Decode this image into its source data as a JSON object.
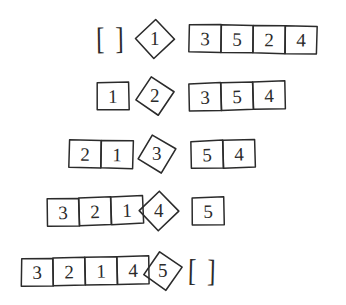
{
  "figure": {
    "kind": "hand-drawn-algorithm-trace",
    "ink_color": "#2b2b2b",
    "background_color": "#ffffff",
    "empty_list_open": "[",
    "empty_list_close": "]",
    "rows": [
      {
        "left": {
          "type": "empty",
          "values": []
        },
        "pivot": "1",
        "right": {
          "type": "cells",
          "values": [
            "3",
            "5",
            "2",
            "4"
          ]
        }
      },
      {
        "left": {
          "type": "cells",
          "values": [
            "1"
          ]
        },
        "pivot": "2",
        "right": {
          "type": "cells",
          "values": [
            "3",
            "5",
            "4"
          ]
        }
      },
      {
        "left": {
          "type": "cells",
          "values": [
            "2",
            "1"
          ]
        },
        "pivot": "3",
        "right": {
          "type": "cells",
          "values": [
            "5",
            "4"
          ]
        }
      },
      {
        "left": {
          "type": "cells",
          "values": [
            "3",
            "2",
            "1"
          ]
        },
        "pivot": "4",
        "right": {
          "type": "cells",
          "values": [
            "5"
          ]
        }
      },
      {
        "left": {
          "type": "cells",
          "values": [
            "3",
            "2",
            "1",
            "4"
          ]
        },
        "pivot": "5",
        "right": {
          "type": "empty",
          "values": []
        }
      }
    ]
  }
}
